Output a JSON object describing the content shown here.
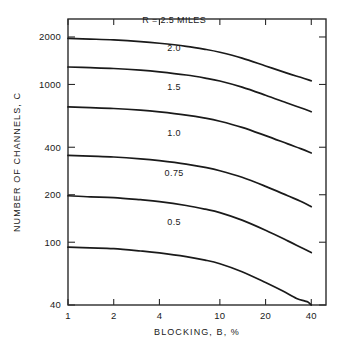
{
  "chart_data": {
    "type": "line",
    "title": "",
    "xlabel": "BLOCKING, B, %",
    "ylabel": "NUMBER OF CHANNELS, C",
    "xscale": "log",
    "yscale": "log",
    "xlim": [
      1,
      50
    ],
    "ylim": [
      40,
      2600
    ],
    "grid": false,
    "legend_position": "inline-curve-labels",
    "xticks": [
      {
        "value": 1,
        "label": "1"
      },
      {
        "value": 2,
        "label": "2"
      },
      {
        "value": 4,
        "label": "4"
      },
      {
        "value": 10,
        "label": "10"
      },
      {
        "value": 20,
        "label": "20"
      },
      {
        "value": 40,
        "label": "40"
      }
    ],
    "yticks": [
      {
        "value": 2000,
        "label": "2000"
      },
      {
        "value": 1000,
        "label": "1000"
      },
      {
        "value": 400,
        "label": "400"
      },
      {
        "value": 200,
        "label": "200"
      },
      {
        "value": 100,
        "label": "100"
      },
      {
        "value": 40,
        "label": "40"
      }
    ],
    "series": [
      {
        "name": "R = 2.5 MILES",
        "label": "R = 2.5 MILES",
        "label_x": 5.0,
        "label_y": 2450,
        "x": [
          1,
          1.4,
          2,
          3,
          4,
          6,
          8,
          10,
          14,
          20,
          28,
          34,
          40
        ],
        "y": [
          1960,
          1940,
          1915,
          1870,
          1825,
          1745,
          1670,
          1600,
          1470,
          1310,
          1175,
          1110,
          1055
        ]
      },
      {
        "name": "2.0",
        "label": "2.0",
        "label_x": 5.0,
        "label_y": 1640,
        "x": [
          1,
          1.4,
          2,
          3,
          4,
          6,
          8,
          10,
          14,
          20,
          28,
          34,
          40
        ],
        "y": [
          1290,
          1278,
          1262,
          1232,
          1202,
          1148,
          1098,
          1052,
          962,
          855,
          760,
          712,
          672
        ]
      },
      {
        "name": "1.5",
        "label": "1.5",
        "label_x": 5.0,
        "label_y": 920,
        "x": [
          1,
          1.4,
          2,
          3,
          4,
          6,
          8,
          10,
          14,
          20,
          28,
          34,
          40
        ],
        "y": [
          720,
          713,
          704,
          687,
          670,
          640,
          612,
          585,
          535,
          474,
          420,
          392,
          368
        ]
      },
      {
        "name": "1.0",
        "label": "1.0",
        "label_x": 5.0,
        "label_y": 470,
        "x": [
          1,
          1.4,
          2,
          3,
          4,
          6,
          8,
          10,
          14,
          20,
          28,
          34,
          40
        ],
        "y": [
          355,
          351,
          347,
          338,
          329,
          313,
          298,
          284,
          258,
          226,
          197,
          182,
          168
        ]
      },
      {
        "name": "0.75",
        "label": "0.75",
        "label_x": 5.0,
        "label_y": 262,
        "x": [
          1,
          1.4,
          2,
          3,
          4,
          6,
          8,
          10,
          14,
          20,
          28,
          34,
          40
        ],
        "y": [
          197,
          194,
          192,
          186,
          181,
          171,
          162,
          154,
          138,
          119,
          102,
          93,
          86
        ]
      },
      {
        "name": "0.5",
        "label": "0.5",
        "label_x": 5.0,
        "label_y": 129,
        "x": [
          1,
          1.4,
          2,
          3,
          4,
          6,
          8,
          10,
          14,
          20,
          26,
          32,
          36,
          38,
          39.5,
          40
        ],
        "y": [
          93,
          92,
          91,
          88,
          85.5,
          81,
          77,
          73,
          65,
          55.5,
          49,
          44,
          42.5,
          41.8,
          40.4,
          40
        ]
      }
    ]
  },
  "axes": {
    "y_title": "NUMBER OF CHANNELS, C",
    "x_title": "BLOCKING, B, %"
  }
}
